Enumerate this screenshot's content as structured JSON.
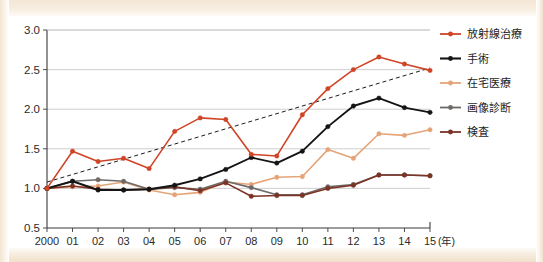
{
  "chart_data": {
    "type": "line",
    "title": "",
    "subtitle": "",
    "xlabel": "(年)",
    "ylabel": "",
    "xlim": [
      2000,
      2015
    ],
    "ylim": [
      0.5,
      3.0
    ],
    "grid": true,
    "legend_position": "right",
    "x": [
      2000,
      2001,
      2002,
      2003,
      2004,
      2005,
      2006,
      2007,
      2008,
      2009,
      2010,
      2011,
      2012,
      2013,
      2014,
      2015
    ],
    "categories": [
      "2000",
      "01",
      "02",
      "03",
      "04",
      "05",
      "06",
      "07",
      "08",
      "09",
      "10",
      "11",
      "12",
      "13",
      "14",
      "15"
    ],
    "ytick_labels": [
      "0.5",
      "1.0",
      "1.5",
      "2.0",
      "2.5",
      "3.0"
    ],
    "ytick_values": [
      0.5,
      1.0,
      1.5,
      2.0,
      2.5,
      3.0
    ],
    "series": [
      {
        "name": "放射線治療",
        "color": "#cf4526",
        "values": [
          1.0,
          1.47,
          1.34,
          1.38,
          1.25,
          1.72,
          1.89,
          1.87,
          1.43,
          1.41,
          1.93,
          2.26,
          2.5,
          2.66,
          2.57,
          2.49
        ]
      },
      {
        "name": "手術",
        "color": "#141414",
        "values": [
          1.0,
          1.09,
          0.98,
          0.98,
          0.99,
          1.04,
          1.12,
          1.24,
          1.39,
          1.32,
          1.47,
          1.78,
          2.04,
          2.14,
          2.02,
          1.96
        ]
      },
      {
        "name": "在宅医療",
        "color": "#e5a478",
        "values": [
          1.0,
          1.02,
          1.03,
          1.08,
          0.98,
          0.92,
          0.95,
          1.08,
          1.05,
          1.14,
          1.15,
          1.49,
          1.38,
          1.69,
          1.67,
          1.74
        ]
      },
      {
        "name": "画像診断",
        "color": "#6e6a68",
        "values": [
          1.0,
          1.09,
          1.11,
          1.09,
          0.99,
          1.01,
          0.99,
          1.09,
          1.01,
          0.92,
          0.92,
          1.02,
          1.05,
          1.17,
          1.17,
          1.16
        ]
      },
      {
        "name": "検査",
        "color": "#7b3326",
        "values": [
          1.0,
          1.03,
          0.99,
          0.98,
          0.99,
          1.02,
          0.97,
          1.07,
          0.9,
          0.91,
          0.91,
          1.0,
          1.04,
          1.17,
          1.17,
          1.16
        ]
      }
    ],
    "trendline": {
      "name": "trend",
      "style": "dashed",
      "color": "#1c1c1c",
      "start": {
        "x": 2000,
        "y": 1.08
      },
      "end": {
        "x": 2015,
        "y": 2.52
      }
    }
  },
  "legend": {
    "items": [
      {
        "label": "放射線治療",
        "color": "#cf4526"
      },
      {
        "label": "手術",
        "color": "#141414"
      },
      {
        "label": "在宅医療",
        "color": "#e5a478"
      },
      {
        "label": "画像診断",
        "color": "#6e6a68"
      },
      {
        "label": "検査",
        "color": "#7b3326"
      }
    ]
  },
  "axes": {
    "x_unit_label": "(年)",
    "y_min_label": "0.5",
    "y_max_label": "3.0"
  }
}
